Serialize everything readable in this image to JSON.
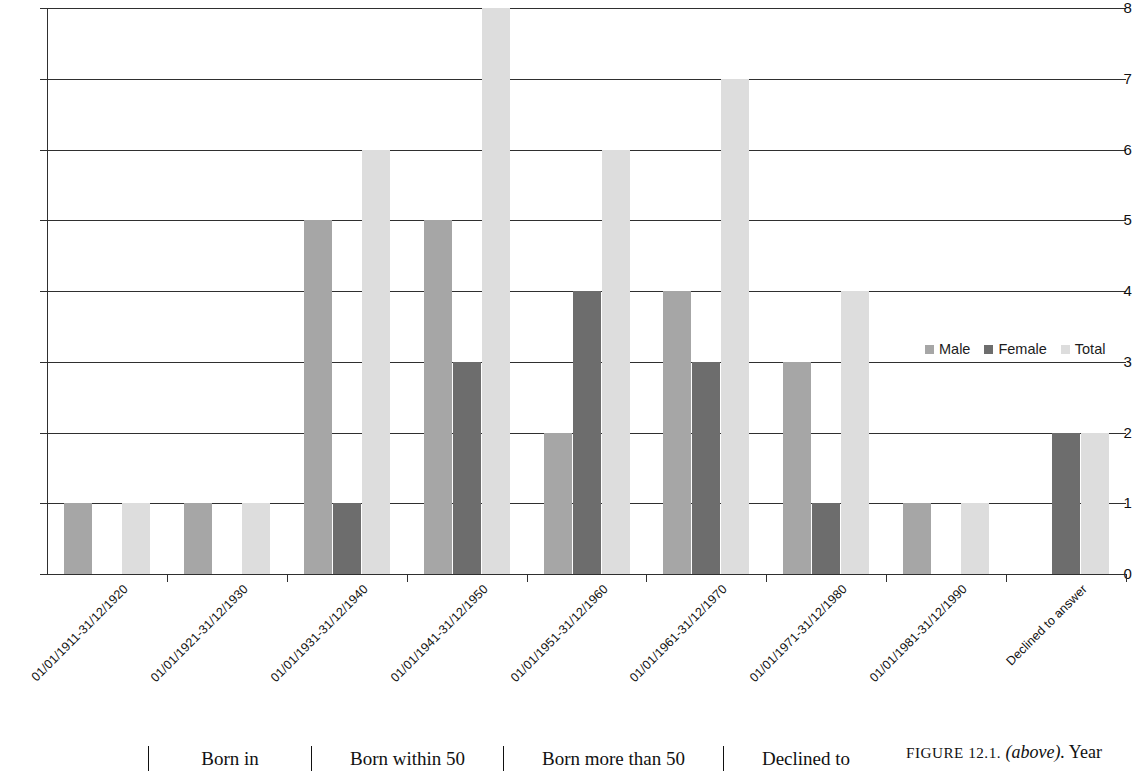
{
  "chart_data": {
    "type": "bar",
    "title": "",
    "xlabel": "",
    "ylabel": "",
    "ylim": [
      0,
      8
    ],
    "yticks": [
      0,
      1,
      2,
      3,
      4,
      5,
      6,
      7,
      8
    ],
    "grid": true,
    "legend_position": "inside-right",
    "categories": [
      "01/01/1911-31/12/1920",
      "01/01/1921-31/12/1930",
      "01/01/1931-31/12/1940",
      "01/01/1941-31/12/1950",
      "01/01/1951-31/12/1960",
      "01/01/1961-31/12/1970",
      "01/01/1971-31/12/1980",
      "01/01/1981-31/12/1990",
      "Declined to answer"
    ],
    "series": [
      {
        "name": "Male",
        "color": "#a6a6a6",
        "values": [
          1,
          1,
          5,
          5,
          2,
          4,
          3,
          1,
          0
        ]
      },
      {
        "name": "Female",
        "color": "#6d6d6d",
        "values": [
          0,
          0,
          1,
          3,
          4,
          3,
          1,
          0,
          2
        ]
      },
      {
        "name": "Total",
        "color": "#dddddd",
        "values": [
          1,
          1,
          6,
          8,
          6,
          7,
          4,
          1,
          2
        ]
      }
    ]
  },
  "legend": {
    "entries": [
      {
        "label": "Male"
      },
      {
        "label": "Female"
      },
      {
        "label": "Total"
      }
    ]
  },
  "table_fragment": {
    "cells": [
      "Born in",
      "Born within 50",
      "Born more than 50",
      "Declined to"
    ]
  },
  "caption": {
    "figure_number": "FIGURE 12.1.",
    "position_note": "(above).",
    "text": "Year"
  }
}
